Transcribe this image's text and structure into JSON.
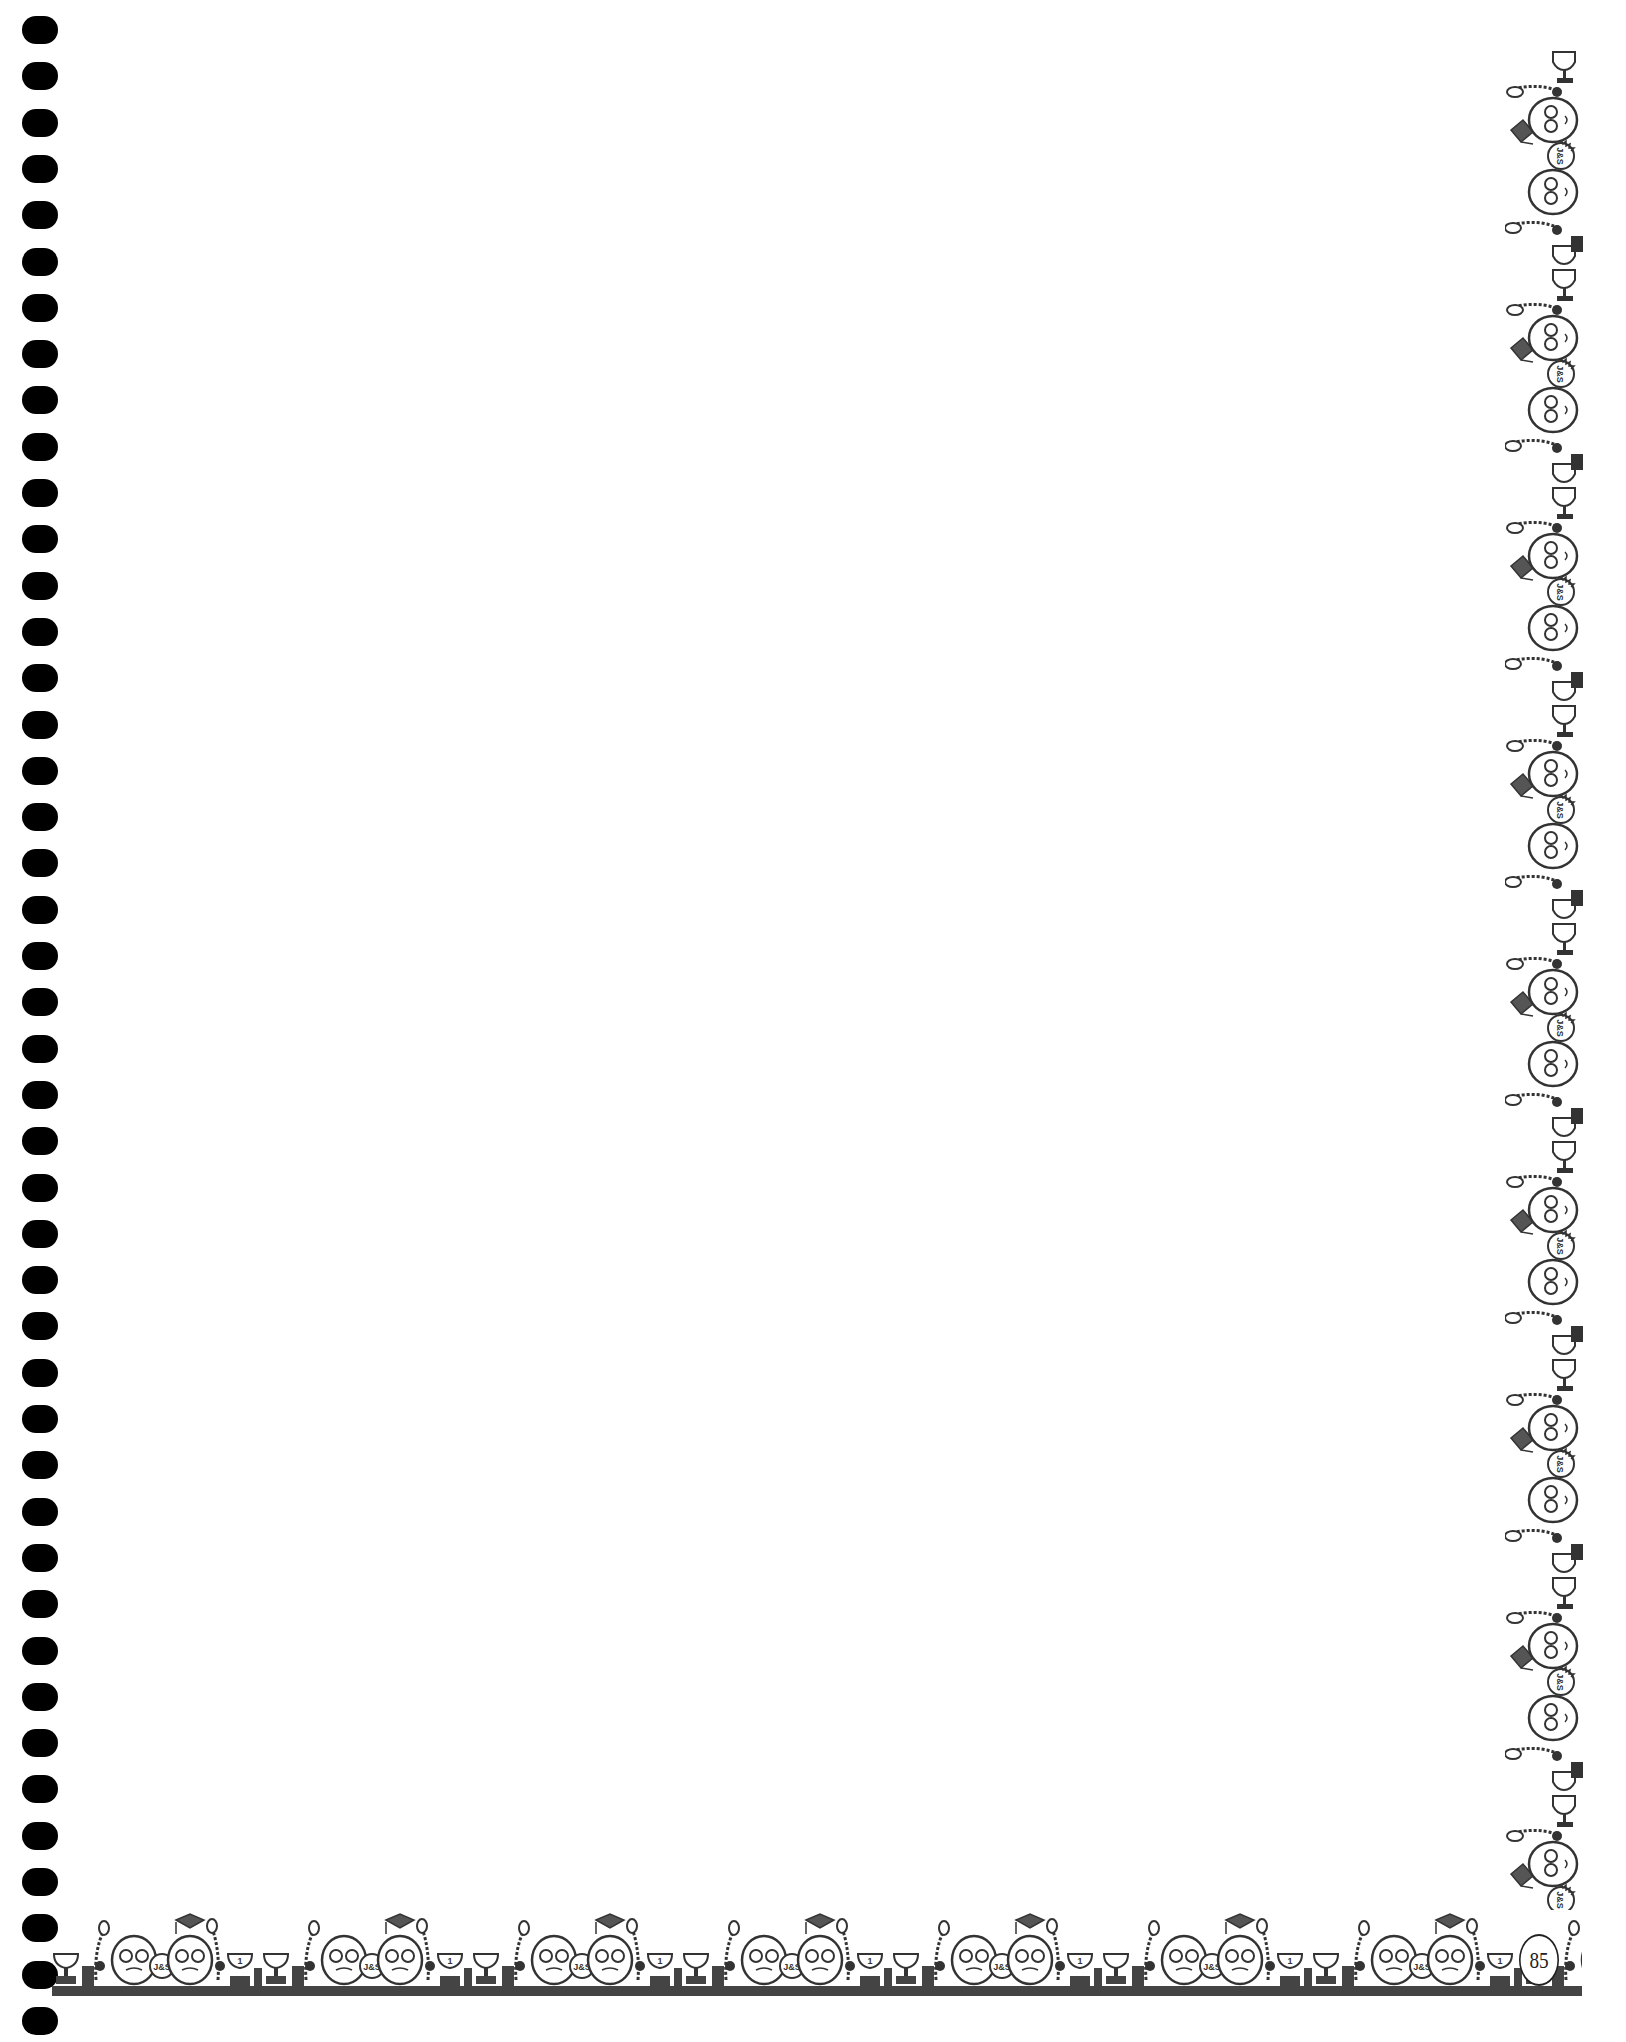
{
  "page": {
    "type": "blank notebook page with decorative border",
    "page_number": "85",
    "background_color": "#ffffff",
    "border_ink_color": "#444444",
    "hole_color": "#000000",
    "hole_count": 44
  },
  "border": {
    "motif": "cartoon graduates with trophies, medals and mortarboard caps",
    "badge_text": "J&S",
    "trophy_label": "1",
    "ribbon_label": "S"
  }
}
